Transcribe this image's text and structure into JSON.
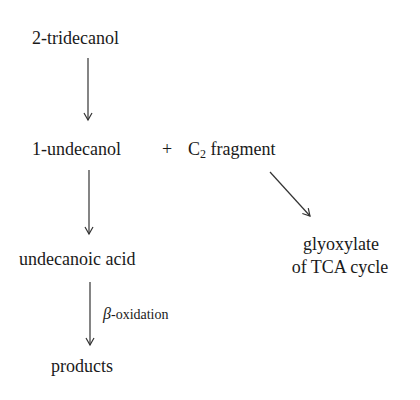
{
  "diagram": {
    "type": "metabolic-pathway",
    "nodes": {
      "start": "2-tridecanol",
      "undecanol": "1-undecanol",
      "plus": "+",
      "c2_prefix": "C",
      "c2_subscript": "2",
      "c2_suffix": " fragment",
      "acid": "undecanoic acid",
      "products": "products",
      "glyoxylate_line1": "glyoxylate",
      "glyoxylate_line2": "of TCA cycle"
    },
    "edges": [
      {
        "from": "2-tridecanol",
        "to": "1-undecanol + C2 fragment",
        "label": ""
      },
      {
        "from": "1-undecanol",
        "to": "undecanoic acid",
        "label": ""
      },
      {
        "from": "C2 fragment",
        "to": "glyoxylate of TCA cycle",
        "label": ""
      },
      {
        "from": "undecanoic acid",
        "to": "products",
        "label": "β-oxidation"
      }
    ],
    "edge_label": {
      "beta_symbol": "β",
      "beta_text": "-oxidation"
    },
    "colors": {
      "text": "#1a1a1a",
      "arrow": "#333333",
      "background": "#ffffff"
    }
  }
}
